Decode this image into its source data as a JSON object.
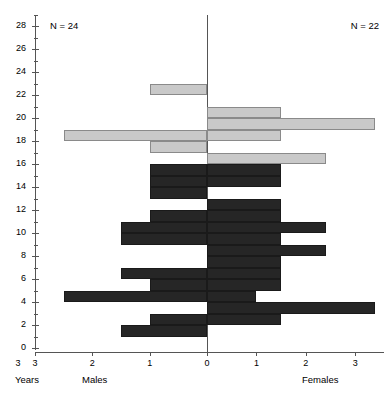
{
  "chart_data": {
    "type": "bar",
    "subtype": "population-pyramid",
    "title": "",
    "xlabel_left": "Males",
    "xlabel_right": "Females",
    "ylabel": "Years",
    "ylim": [
      0,
      29
    ],
    "ytick_labels": [
      "0",
      "2",
      "4",
      "6",
      "8",
      "10",
      "12",
      "14",
      "16",
      "18",
      "20",
      "22",
      "24",
      "26",
      "28"
    ],
    "ytick_values": [
      0,
      2,
      4,
      6,
      8,
      10,
      12,
      14,
      16,
      18,
      20,
      22,
      24,
      26,
      28
    ],
    "yminor_step": 1,
    "xtick_labels_left": [
      "3",
      "2",
      "1",
      "0"
    ],
    "xtick_values_left": [
      3,
      2,
      1,
      0
    ],
    "xtick_labels_right": [
      "1",
      "2",
      "3"
    ],
    "xtick_values_right": [
      1,
      2,
      3
    ],
    "xlim_left": 3,
    "xlim_right": 3.5,
    "grid": false,
    "legend_position": "none",
    "annotations": [
      {
        "name": "males-count",
        "text": "N = 24",
        "side": "left"
      },
      {
        "name": "females-count",
        "text": "N = 22",
        "side": "right"
      }
    ],
    "series": [
      {
        "name": "males-light",
        "side": "left",
        "color": "#c9c9c9",
        "bars": [
          {
            "age": 22,
            "value": 1.0
          },
          {
            "age": 18,
            "value": 2.5
          },
          {
            "age": 17,
            "value": 1.0
          }
        ]
      },
      {
        "name": "males-dark",
        "side": "left",
        "color": "#262626",
        "bars": [
          {
            "age": 15,
            "value": 1.0
          },
          {
            "age": 14,
            "value": 1.0
          },
          {
            "age": 13,
            "value": 1.0
          },
          {
            "age": 11,
            "value": 1.0
          },
          {
            "age": 10,
            "value": 1.5
          },
          {
            "age": 9,
            "value": 1.5
          },
          {
            "age": 6,
            "value": 1.5
          },
          {
            "age": 5,
            "value": 1.0
          },
          {
            "age": 4,
            "value": 2.5
          },
          {
            "age": 2,
            "value": 1.0
          },
          {
            "age": 1,
            "value": 1.5
          }
        ]
      },
      {
        "name": "females-light",
        "side": "right",
        "color": "#c9c9c9",
        "bars": [
          {
            "age": 20,
            "value": 1.5
          },
          {
            "age": 19,
            "value": 3.4
          },
          {
            "age": 18,
            "value": 1.5
          },
          {
            "age": 16,
            "value": 2.4
          }
        ]
      },
      {
        "name": "females-dark",
        "side": "right",
        "color": "#262626",
        "bars": [
          {
            "age": 15,
            "value": 1.5
          },
          {
            "age": 14,
            "value": 1.5
          },
          {
            "age": 12,
            "value": 1.5
          },
          {
            "age": 11,
            "value": 1.5
          },
          {
            "age": 10,
            "value": 2.4
          },
          {
            "age": 9,
            "value": 1.5
          },
          {
            "age": 8,
            "value": 2.4
          },
          {
            "age": 7,
            "value": 1.5
          },
          {
            "age": 6,
            "value": 1.5
          },
          {
            "age": 5,
            "value": 1.5
          },
          {
            "age": 4,
            "value": 1.0
          },
          {
            "age": 3,
            "value": 3.4
          },
          {
            "age": 2,
            "value": 1.5
          }
        ]
      }
    ]
  },
  "axes": {
    "years_label": "Years",
    "males_label": "Males",
    "females_label": "Females"
  },
  "colors": {
    "light_bar": "#c9c9c9",
    "dark_bar": "#262626",
    "axis": "#555555",
    "background": "#ffffff"
  }
}
